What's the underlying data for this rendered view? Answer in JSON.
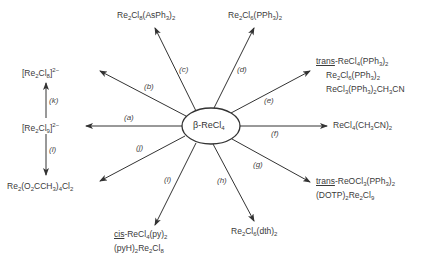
{
  "center": {
    "label": "β-ReCl4"
  },
  "reactions": [
    {
      "id": "a",
      "label": "(a)"
    },
    {
      "id": "b",
      "label": "(b)"
    },
    {
      "id": "c",
      "label": "(c)"
    },
    {
      "id": "d",
      "label": "(d)"
    },
    {
      "id": "e",
      "label": "(e)"
    },
    {
      "id": "f",
      "label": "(f)"
    },
    {
      "id": "g",
      "label": "(g)"
    },
    {
      "id": "h",
      "label": "(h)"
    },
    {
      "id": "i",
      "label": "(i)"
    },
    {
      "id": "j",
      "label": "(j)"
    },
    {
      "id": "k",
      "label": "(k)"
    },
    {
      "id": "l",
      "label": "(l)"
    }
  ],
  "products": {
    "a": [
      "[Re2Cl9]2-"
    ],
    "k": [
      "[Re2Cl8]2-"
    ],
    "l": [
      "Re2(O2CCH3)4Cl2"
    ],
    "c": [
      "Re2Cl8(AsPh3)2"
    ],
    "d": [
      "Re2Cl6(PPh3)2"
    ],
    "e": [
      "trans-ReCl4(PPh3)2",
      "Re2Cl6(PPh3)2",
      "ReCl3(PPh3)2CH3CN"
    ],
    "f": [
      "ReCl4(CH3CN)2"
    ],
    "g": [
      "trans-ReOCl3(PPh3)2",
      "(DOTP)2Re2Cl9"
    ],
    "h": [
      "Re2Cl6(dth)2"
    ],
    "i": [
      "cis-ReCl4(py)2",
      "(pyH)2Re2Cl8"
    ]
  }
}
